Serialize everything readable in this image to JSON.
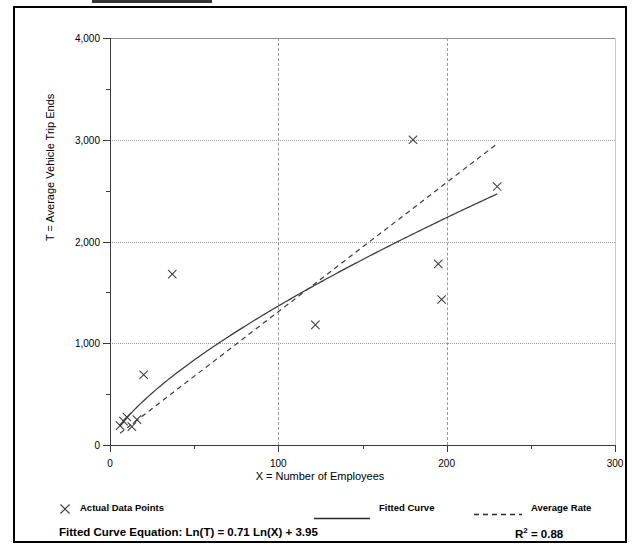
{
  "chart_data": {
    "type": "scatter",
    "title": "",
    "xlabel": "X = Number of Employees",
    "ylabel": "T = Average Vehicle Trip Ends",
    "xlim": [
      0,
      300
    ],
    "ylim": [
      0,
      4000
    ],
    "grid": true,
    "x_ticks": [
      0,
      100,
      200,
      300
    ],
    "x_tick_labels": [
      "0",
      "100",
      "200",
      "300"
    ],
    "x_minor_ticks": [
      50,
      150,
      250
    ],
    "y_ticks": [
      0,
      1000,
      2000,
      3000,
      4000
    ],
    "y_tick_labels": [
      "0",
      "1,000",
      "2,000",
      "3,000",
      "4,000"
    ],
    "y_minor_ticks": [
      500,
      1500,
      2500,
      3500
    ],
    "legend_position": "below-axes",
    "series": [
      {
        "name": "Actual Data Points",
        "type": "scatter",
        "marker": "x",
        "points": [
          [
            6,
            190
          ],
          [
            8,
            235
          ],
          [
            10,
            275
          ],
          [
            13,
            180
          ],
          [
            16,
            250
          ],
          [
            20,
            690
          ],
          [
            37,
            1680
          ],
          [
            122,
            1180
          ],
          [
            180,
            3000
          ],
          [
            195,
            1780
          ],
          [
            197,
            1430
          ],
          [
            230,
            2540
          ]
        ]
      },
      {
        "name": "Fitted Curve",
        "type": "line",
        "style": "solid",
        "equation": "Ln(T) = 0.71 Ln(X) + 3.95",
        "a": 51.935,
        "b": 0.71,
        "x_start": 6,
        "x_end": 230
      },
      {
        "name": "Average Rate",
        "type": "line",
        "style": "dashed",
        "slope": 12.7,
        "intercept": 40,
        "x_start": 6,
        "x_end": 230
      }
    ]
  },
  "axes": {
    "y_title": "T = Average Vehicle Trip Ends",
    "x_title": "X = Number of Employees"
  },
  "legend": {
    "actual_points_label": "Actual Data Points",
    "fitted_curve_label": "Fitted Curve",
    "average_rate_label": "Average Rate",
    "actual_points_icon": "x-cross-marker-icon",
    "fitted_curve_icon": "solid-line-icon",
    "average_rate_icon": "dashed-line-icon"
  },
  "footer": {
    "equation_label": "Fitted Curve Equation:",
    "equation_value": "Ln(T) = 0.71 Ln(X) + 3.95",
    "equation_full": "Fitted Curve Equation:  Ln(T) = 0.71 Ln(X) + 3.95",
    "r_squared_base": "R",
    "r_squared_exponent": "2",
    "r_squared_value": " = 0.88",
    "r_squared_full": "R2 = 0.88"
  },
  "colors": {
    "axis": "#3b3b3b",
    "grid": "#9a9a9a",
    "series": "#3b3b3b",
    "frame": "#000000",
    "background": "#ffffff"
  }
}
